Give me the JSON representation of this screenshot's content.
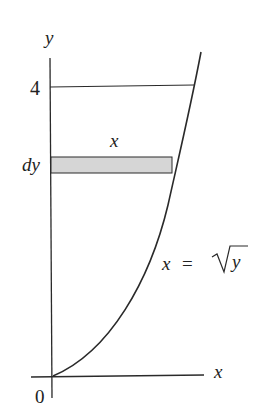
{
  "figure": {
    "axes": {
      "x_label": "x",
      "y_label": "y",
      "origin_label": "0",
      "y_tick_label": "4"
    },
    "strip": {
      "width_label": "x",
      "thickness_label": "dy",
      "fill_color": "#d6d6d6"
    },
    "curve": {
      "equation_lhs": "x",
      "equation_eq": "=",
      "equation_rhs_radicand": "y"
    },
    "colors": {
      "line": "#2a2a2a",
      "background": "#ffffff"
    }
  }
}
